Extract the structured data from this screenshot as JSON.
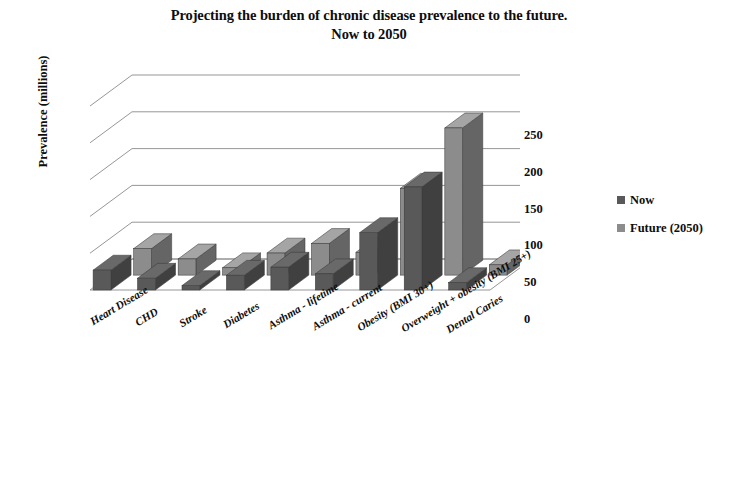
{
  "title": {
    "line1": "Projecting the burden of chronic disease prevalence to the future.",
    "line2": "Now to 2050"
  },
  "axis": {
    "ylabel": "Prevalence (millions)",
    "yticks": [
      "0",
      "50",
      "100",
      "150",
      "200",
      "250"
    ]
  },
  "legend": {
    "position": "right",
    "items": [
      {
        "label": "Now",
        "color": "#595959"
      },
      {
        "label": "Future (2050)",
        "color": "#8c8c8c"
      }
    ]
  },
  "chart_data": {
    "type": "bar",
    "title": "Projecting the burden of chronic disease prevalence to the future. Now to 2050",
    "xlabel": "",
    "ylabel": "Prevalence (millions)",
    "ylim": [
      0,
      250
    ],
    "ytick_step": 50,
    "grid": true,
    "three_d": true,
    "legend_position": "right",
    "categories": [
      "Heart Disease",
      "CHD",
      "Stroke",
      "Diabetes",
      "Asthma - lifetime",
      "Asthma - current",
      "Obesity (BMI 30+)",
      "Overweight + obesity (BMI 25+)",
      "Dental Caries"
    ],
    "series": [
      {
        "name": "Now",
        "color": "#595959",
        "values": [
          27,
          16,
          6,
          20,
          31,
          22,
          78,
          140,
          10
        ]
      },
      {
        "name": "Future (2050)",
        "color": "#8c8c8c",
        "values": [
          36,
          22,
          10,
          30,
          43,
          31,
          118,
          200,
          14
        ]
      }
    ]
  }
}
